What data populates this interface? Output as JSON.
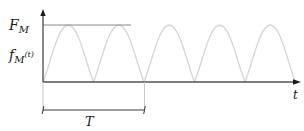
{
  "labels": {
    "peak_label_main": "F",
    "peak_label_sub": "M",
    "func_label_main": "f",
    "func_label_sub": "M",
    "func_label_arg": "(t)",
    "time_axis_label": "t",
    "period_label": "T"
  },
  "colors": {
    "axis": "#3a3a3a",
    "curve": "#d9d9d9",
    "reference_line": "#8a8a8a",
    "text": "#1a1a1a"
  },
  "waveform": {
    "type": "rectified-sine",
    "arches": 5,
    "zero_crossings_px": [
      43,
      93.5,
      144,
      194.5,
      245,
      295.5
    ],
    "peak_y_px": 25,
    "baseline_y_px": 82
  }
}
